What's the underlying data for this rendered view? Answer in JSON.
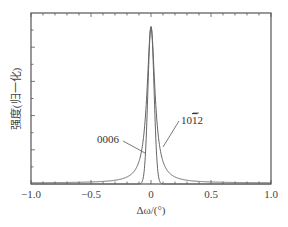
{
  "chart_data": {
    "type": "line",
    "title": "",
    "xlabel": "Δω/(°)",
    "ylabel": "强度(归一化)",
    "xlim": [
      -1.0,
      1.0
    ],
    "ylim": [
      0,
      1.0
    ],
    "x_ticks": [
      "-1.0",
      "-0.5",
      "0",
      "0.5",
      "1.0"
    ],
    "y_ticks_labeled": false,
    "grid": false,
    "legend": "none (inline annotations)",
    "series": [
      {
        "name": "0006",
        "shape": "narrow peak",
        "center": 0.0,
        "peak": 0.92,
        "fwhm": 0.05,
        "x": [
          -1.0,
          -0.2,
          -0.1,
          -0.08,
          -0.06,
          -0.04,
          -0.02,
          0.0,
          0.02,
          0.04,
          0.06,
          0.08,
          0.1,
          0.2,
          1.0
        ],
        "y": [
          0.0,
          0.0,
          0.005,
          0.02,
          0.08,
          0.25,
          0.65,
          0.92,
          0.65,
          0.25,
          0.08,
          0.02,
          0.005,
          0.0,
          0.0
        ]
      },
      {
        "name": "101̄2",
        "shape": "broad Lorentzian",
        "center": 0.0,
        "peak": 0.92,
        "fwhm": 0.08,
        "x": [
          -1.0,
          -0.75,
          -0.5,
          -0.3,
          -0.2,
          -0.1,
          -0.05,
          0.0,
          0.05,
          0.1,
          0.2,
          0.3,
          0.5,
          0.75,
          1.0
        ],
        "y": [
          0.01,
          0.015,
          0.025,
          0.06,
          0.12,
          0.3,
          0.55,
          0.92,
          0.55,
          0.3,
          0.12,
          0.06,
          0.025,
          0.015,
          0.01
        ]
      }
    ],
    "annotations": [
      {
        "text": "0006",
        "points_to": "narrow curve",
        "at": [
          -0.3,
          0.35
        ]
      },
      {
        "text": "101̄2",
        "points_to": "broad curve",
        "at": [
          0.25,
          0.4
        ]
      }
    ]
  },
  "labels": {
    "ylabel": "强度(归一化)",
    "xlabel": "Δω/(°)",
    "ann_0006": "0006",
    "ann_1012_prefix": "10",
    "ann_1012_bar": "1",
    "ann_1012_suffix": "2",
    "xticks": [
      "−1.0",
      "−0.5",
      "0",
      "0.5",
      "1.0"
    ]
  }
}
